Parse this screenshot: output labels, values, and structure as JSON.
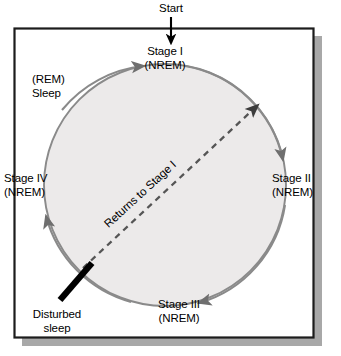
{
  "figure": {
    "title_alt": "Sleep cycle stages diagram",
    "colors": {
      "frame_border": "#1c1c1c",
      "frame_fill": "#ffffff",
      "shadow": "#a8a8a8",
      "circle_fill": "#eceaea",
      "circle_stroke": "#8a8a8a",
      "arrow_black": "#000000",
      "dashed_line": "#555555",
      "text": "#000000"
    },
    "entry": {
      "label": "Start"
    },
    "cycle_nodes": [
      {
        "name": "stage-1",
        "line1": "Stage I",
        "line2": "(NREM)",
        "position": "top"
      },
      {
        "name": "stage-2",
        "line1": "Stage II",
        "line2": "(NREM)",
        "position": "right"
      },
      {
        "name": "stage-3",
        "line1": "Stage III",
        "line2": "(NREM)",
        "position": "bottom"
      },
      {
        "name": "stage-4",
        "line1": "Stage IV",
        "line2": "(NREM)",
        "position": "left"
      },
      {
        "name": "rem",
        "line1": "(REM)",
        "line2": "Sleep",
        "position": "upper-left"
      }
    ],
    "annotations": {
      "returns": "Returns to Stage I",
      "disturbed_line1": "Disturbed",
      "disturbed_line2": "sleep"
    }
  },
  "labels": {
    "start": "Start",
    "stage_1": "Stage I\n(NREM)",
    "stage_2": "Stage II\n(NREM)",
    "stage_3": "Stage III\n(NREM)",
    "stage_4": "Stage IV\n(NREM)",
    "rem_sleep": "(REM)\nSleep",
    "returns_to_stage_1": "Returns to Stage I",
    "disturbed_sleep": "Disturbed\nsleep"
  }
}
